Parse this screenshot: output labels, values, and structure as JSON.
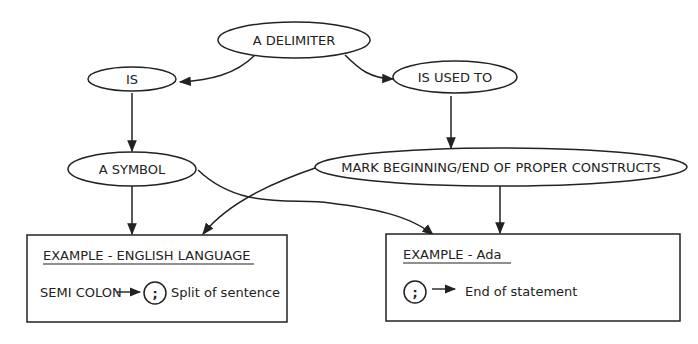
{
  "nodes": {
    "delimiter": "A DELIMITER",
    "is": "IS",
    "is_used_to": "IS USED TO",
    "a_symbol": "A SYMBOL",
    "mark": "MARK BEGINNING/END OF PROPER CONSTRUCTS"
  },
  "boxes": {
    "english": {
      "title": "EXAMPLE - ENGLISH LANGUAGE",
      "left": "SEMI COLON",
      "symbol": ";",
      "right": "Split of sentence"
    },
    "ada": {
      "title": "EXAMPLE - Ada",
      "symbol": ";",
      "right": "End of statement"
    }
  },
  "colors": {
    "ink": "#222222",
    "background": "#ffffff"
  }
}
